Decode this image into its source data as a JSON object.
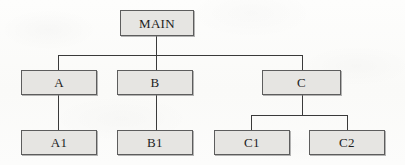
{
  "diagram": {
    "type": "hierarchy-tree",
    "title": "",
    "orientation": "top-down",
    "style": {
      "node_fill": "#e6e5e2",
      "node_border": "#5d5d5d",
      "edge_color": "#3a3a3a",
      "background": "#fbfbfa",
      "text_color": "#1d1d1d"
    },
    "nodes": [
      {
        "id": "MAIN",
        "label": "MAIN",
        "level": 0,
        "x": 120,
        "y": 10,
        "w": 74,
        "h": 26,
        "font_size": 13
      },
      {
        "id": "A",
        "label": "A",
        "level": 1,
        "x": 21,
        "y": 70,
        "w": 76,
        "h": 25,
        "font_size": 13
      },
      {
        "id": "B",
        "label": "B",
        "level": 1,
        "x": 117,
        "y": 70,
        "w": 76,
        "h": 25,
        "font_size": 13
      },
      {
        "id": "C",
        "label": "C",
        "level": 1,
        "x": 262,
        "y": 70,
        "w": 79,
        "h": 25,
        "font_size": 13
      },
      {
        "id": "A1",
        "label": "A1",
        "level": 2,
        "x": 21,
        "y": 130,
        "w": 76,
        "h": 25,
        "font_size": 13
      },
      {
        "id": "B1",
        "label": "B1",
        "level": 2,
        "x": 117,
        "y": 130,
        "w": 76,
        "h": 25,
        "font_size": 13
      },
      {
        "id": "C1",
        "label": "C1",
        "level": 2,
        "x": 214,
        "y": 130,
        "w": 76,
        "h": 25,
        "font_size": 13
      },
      {
        "id": "C2",
        "label": "C2",
        "level": 2,
        "x": 309,
        "y": 130,
        "w": 76,
        "h": 25,
        "font_size": 13
      }
    ],
    "edges": [
      {
        "from": "MAIN",
        "to": "A",
        "kind": "orthogonal"
      },
      {
        "from": "MAIN",
        "to": "B",
        "kind": "orthogonal"
      },
      {
        "from": "MAIN",
        "to": "C",
        "kind": "orthogonal"
      },
      {
        "from": "A",
        "to": "A1",
        "kind": "straight"
      },
      {
        "from": "B",
        "to": "B1",
        "kind": "straight"
      },
      {
        "from": "C",
        "to": "C1",
        "kind": "orthogonal"
      },
      {
        "from": "C",
        "to": "C2",
        "kind": "orthogonal"
      }
    ],
    "segments": [
      {
        "id": "main-stem",
        "dir": "v",
        "x": 156,
        "y": 36,
        "len": 19
      },
      {
        "id": "level1-bus",
        "dir": "h",
        "x": 58,
        "y": 55,
        "len": 245
      },
      {
        "id": "drop-a",
        "dir": "v",
        "x": 58,
        "y": 55,
        "len": 15
      },
      {
        "id": "drop-b",
        "dir": "v",
        "x": 156,
        "y": 55,
        "len": 15
      },
      {
        "id": "drop-c",
        "dir": "v",
        "x": 302,
        "y": 55,
        "len": 15
      },
      {
        "id": "a-to-a1",
        "dir": "v",
        "x": 58,
        "y": 95,
        "len": 35
      },
      {
        "id": "b-to-b1",
        "dir": "v",
        "x": 156,
        "y": 95,
        "len": 35
      },
      {
        "id": "c-stem",
        "dir": "v",
        "x": 302,
        "y": 95,
        "len": 20
      },
      {
        "id": "c-bus",
        "dir": "h",
        "x": 251,
        "y": 115,
        "len": 96
      },
      {
        "id": "drop-c1",
        "dir": "v",
        "x": 251,
        "y": 115,
        "len": 15
      },
      {
        "id": "drop-c2",
        "dir": "v",
        "x": 347,
        "y": 115,
        "len": 15
      }
    ]
  }
}
